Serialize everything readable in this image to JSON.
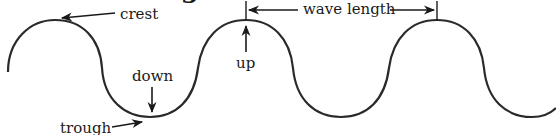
{
  "diagram": {
    "heading_partial": "Wavelength",
    "labels": {
      "crest": "crest",
      "trough": "trough",
      "down": "down",
      "up": "up",
      "wavelength": "wave length"
    },
    "wave": {
      "stroke_color": "#2a2a2a",
      "crest_x": [
        55,
        246,
        437
      ],
      "trough_x": [
        150,
        341,
        532
      ],
      "crest_y": 20,
      "trough_y": 117
    },
    "wavelength_span": {
      "start_x": 246,
      "end_x": 437
    }
  }
}
